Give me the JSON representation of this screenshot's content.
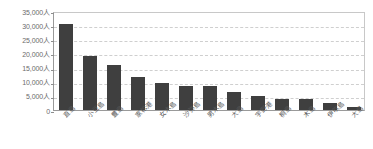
{
  "chart_data": {
    "type": "bar",
    "title": "",
    "subtitle": "",
    "xlabel": "",
    "ylabel": "",
    "unit_suffix": "人",
    "ylim": [
      0,
      35000
    ],
    "ytick_step": 5000,
    "grid": true,
    "grid_axis": "y",
    "legend": false,
    "legend_position": "none",
    "orientation": "vertical",
    "bar_color": "#3f3f3f",
    "axis_color": "#9a9a9a",
    "gridline_color": "#cfcfcf",
    "tick_label_color": "#6b6b6b",
    "xtick_rotation": -45,
    "ytick_labels": [
      "35,000人",
      "30,000人",
      "25,000人",
      "20,000人",
      "15,000人",
      "10,000人",
      "5,000人",
      "0"
    ],
    "ytick_values": [
      35000,
      30000,
      25000,
      20000,
      15000,
      10000,
      5000,
      0
    ],
    "categories": [
      "直島",
      "小豆島",
      "豊島",
      "家松港",
      "女木島",
      "沙弥島",
      "男木島",
      "大島",
      "宇野港",
      "桐島",
      "木島",
      "伊吹島",
      "大島"
    ],
    "values": [
      30500,
      19000,
      16000,
      11500,
      9500,
      8500,
      8500,
      6500,
      5000,
      4000,
      4000,
      2500,
      1000
    ],
    "series": [
      {
        "name": "来場者数",
        "values": [
          30500,
          19000,
          16000,
          11500,
          9500,
          8500,
          8500,
          6500,
          5000,
          4000,
          4000,
          2500,
          1000
        ]
      }
    ]
  }
}
